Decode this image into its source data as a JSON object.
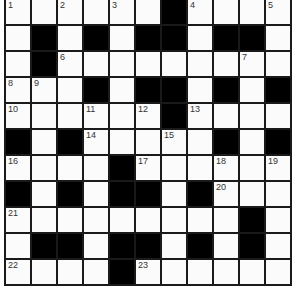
{
  "puzzle": {
    "rows": 11,
    "cols": 11,
    "colors": {
      "block": "#000000",
      "cell": "#fbfbfb",
      "grid_line": "#1a1a1a",
      "number": "#333333"
    },
    "grid": [
      [
        "1",
        "",
        "2",
        "",
        "3",
        "",
        "#",
        "4",
        "",
        "",
        "5"
      ],
      [
        "",
        "#",
        "",
        "#",
        "",
        "#",
        "#",
        "",
        "#",
        "#",
        ""
      ],
      [
        "",
        "#",
        "6",
        "",
        "",
        "",
        "",
        "",
        "",
        "7",
        ""
      ],
      [
        "8",
        "9",
        "",
        "#",
        "",
        "#",
        "#",
        "",
        "#",
        "",
        "#"
      ],
      [
        "10",
        "",
        "",
        "11",
        "",
        "12",
        "#",
        "13",
        "",
        "",
        ""
      ],
      [
        "#",
        "",
        "#",
        "14",
        "",
        "",
        "15",
        "",
        "#",
        "",
        "#"
      ],
      [
        "16",
        "",
        "",
        "",
        "#",
        "17",
        "",
        "",
        "18",
        "",
        "19"
      ],
      [
        "#",
        "",
        "#",
        "",
        "#",
        "#",
        "",
        "#",
        "20",
        "",
        ""
      ],
      [
        "21",
        "",
        "",
        "",
        "",
        "",
        "",
        "",
        "",
        "#",
        ""
      ],
      [
        "",
        "#",
        "#",
        "",
        "#",
        "#",
        "",
        "#",
        "",
        "#",
        ""
      ],
      [
        "22",
        "",
        "",
        "",
        "#",
        "23",
        "",
        "",
        "",
        "",
        ""
      ]
    ]
  }
}
